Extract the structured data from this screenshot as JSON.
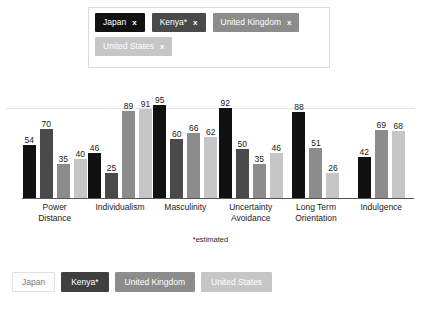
{
  "filter_panel": {
    "chips": [
      {
        "label": "Japan",
        "close": "x",
        "bg": "#111111",
        "fg": "#ffffff"
      },
      {
        "label": "Kenya*",
        "close": "x",
        "bg": "#4a4a4a",
        "fg": "#ffffff"
      },
      {
        "label": "United Kingdom",
        "close": "x",
        "bg": "#8c8c8c",
        "fg": "#ffffff"
      },
      {
        "label": "United States",
        "close": "x",
        "bg": "#c6c6c6",
        "fg": "#ffffff"
      }
    ]
  },
  "footnote": "*estimated",
  "legend": {
    "items": [
      {
        "label": "Japan",
        "bg": "#fcfcfc",
        "fg": "#7a7a7a",
        "border": "#e0e0e0"
      },
      {
        "label": "Kenya*",
        "bg": "#3f3f3f",
        "fg": "#ffffff",
        "border": "#3f3f3f"
      },
      {
        "label": "United Kingdom",
        "bg": "#8c8c8c",
        "fg": "#ffffff",
        "border": "#8c8c8c"
      },
      {
        "label": "United States",
        "bg": "#c6c6c6",
        "fg": "#ffffff",
        "border": "#c6c6c6"
      }
    ]
  },
  "chart_data": {
    "type": "bar",
    "title": "",
    "xlabel": "",
    "ylabel": "",
    "ylim": [
      0,
      100
    ],
    "grid": true,
    "gridlines": [
      80
    ],
    "legend_position": "bottom",
    "categories": [
      "Power Distance",
      "Individualism",
      "Masculinity",
      "Uncertainty Avoidance",
      "Long Term Orientation",
      "Indulgence"
    ],
    "series": [
      {
        "name": "Japan",
        "color": "#111111",
        "values": [
          54,
          46,
          95,
          92,
          88,
          42
        ]
      },
      {
        "name": "Kenya*",
        "color": "#4a4a4a",
        "values": [
          70,
          25,
          60,
          50,
          null,
          null
        ]
      },
      {
        "name": "United Kingdom",
        "color": "#8c8c8c",
        "values": [
          35,
          89,
          66,
          35,
          51,
          69
        ]
      },
      {
        "name": "United States",
        "color": "#c6c6c6",
        "values": [
          40,
          91,
          62,
          46,
          26,
          68
        ]
      }
    ]
  }
}
